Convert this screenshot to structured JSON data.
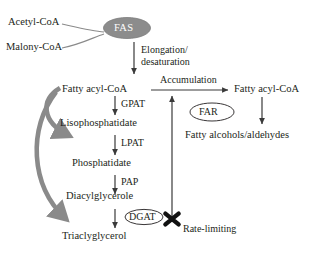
{
  "diagram": {
    "substrates": {
      "acetyl_coa": "Acetyl-CoA",
      "malonyl_coa": "Malony-CoA"
    },
    "complexes": {
      "fas": "FAS",
      "far": "FAR",
      "dgat": "DGAT"
    },
    "pathway_nodes": {
      "fatty_acyl_coa": "Fatty acyl-CoA",
      "lysophosphatidate": "Lisophosphatidate",
      "phosphatidate": "Phosphatidate",
      "diacylglycerol": "Diacylglycerole",
      "triacylglycerol": "Triaclyglycerol",
      "fatty_acyl_coa_pool": "Fatty acyl-CoA",
      "fatty_alcohols": "Fatty alcohols/aldehydes"
    },
    "enzymes": {
      "gpat": "GPAT",
      "lpat": "LPAT",
      "pap": "PAP"
    },
    "processes": {
      "elongation_desaturation": "Elongation/\ndesaturation",
      "accumulation": "Accumulation",
      "rate_limiting": "Rate-limiting"
    },
    "colors": {
      "text": "#231f20",
      "arrow": "#3a3a3a",
      "feedback_arrow": "#7a7a7a",
      "fas_fill": "#8c8c8c",
      "fas_text": "#ffffff",
      "background": "#ffffff",
      "block_marker": "#111111"
    }
  }
}
